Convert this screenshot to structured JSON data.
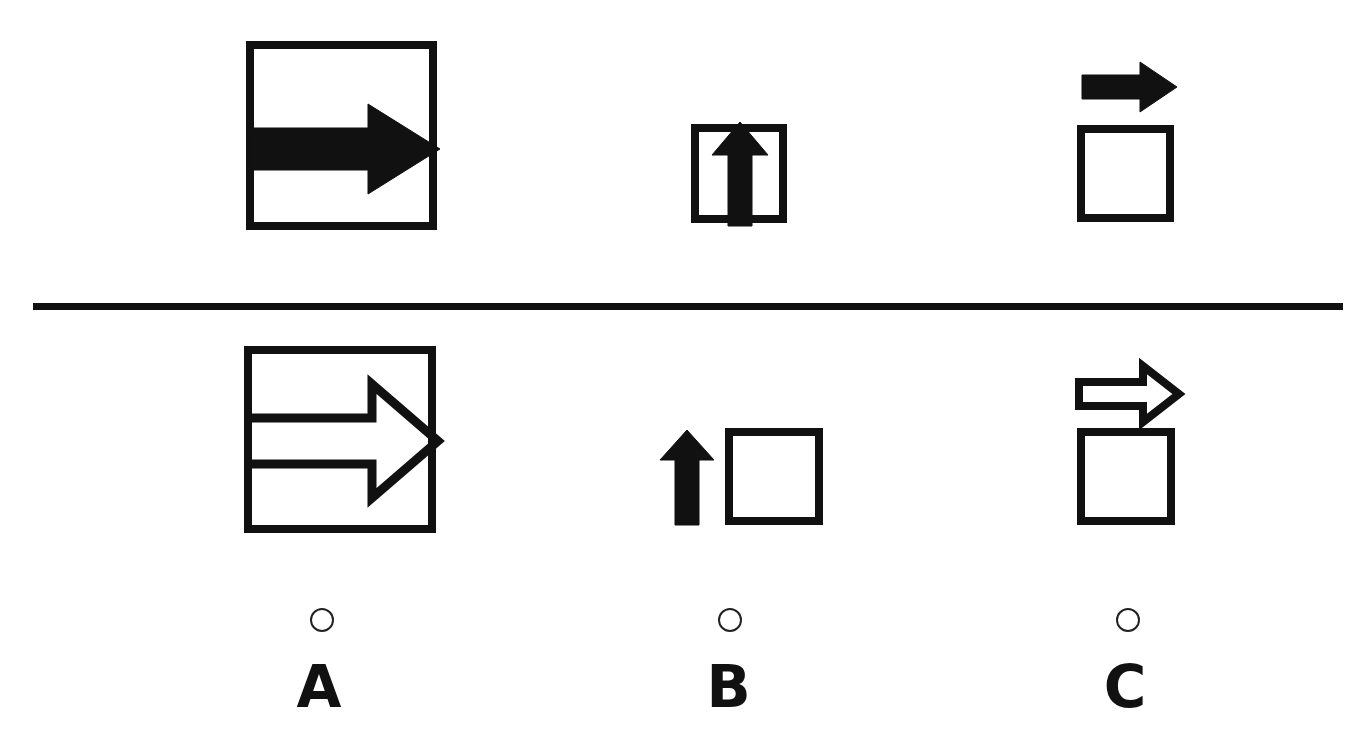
{
  "question": {
    "type": "visual-analogy-matrix",
    "prompt_row_label": "top-row-figures",
    "answer_row_label": "bottom-row-figures",
    "accent_color": "#111111",
    "background_color": "#ffffff",
    "divider": {
      "name": "horizontal-rule",
      "x": 33,
      "y": 303,
      "width": 1310,
      "height": 7,
      "color": "#111111"
    }
  },
  "top_row": {
    "items": [
      {
        "id": "top-A",
        "column": "A",
        "description": "filled right arrow inside large square",
        "square": {
          "x": 246,
          "y": 41,
          "w": 191,
          "h": 189,
          "stroke": 8,
          "fill": "none"
        },
        "arrow": {
          "direction": "right",
          "style": "filled",
          "x": 250,
          "y": 106,
          "w": 188,
          "h": 86,
          "position": "inside-square"
        }
      },
      {
        "id": "top-B",
        "column": "B",
        "description": "filled up arrow inside small square",
        "square": {
          "x": 691,
          "y": 124,
          "w": 96,
          "h": 99,
          "stroke": 8,
          "fill": "none"
        },
        "arrow": {
          "direction": "up",
          "style": "filled",
          "x": 712,
          "y": 122,
          "w": 54,
          "h": 101,
          "position": "inside-square"
        }
      },
      {
        "id": "top-C",
        "column": "C",
        "description": "filled right arrow above empty square",
        "square": {
          "x": 1077,
          "y": 125,
          "w": 97,
          "h": 97,
          "stroke": 8,
          "fill": "none"
        },
        "arrow": {
          "direction": "right",
          "style": "filled",
          "x": 1082,
          "y": 62,
          "w": 93,
          "h": 48,
          "position": "above-square"
        }
      }
    ]
  },
  "bottom_row": {
    "items": [
      {
        "id": "bottom-A",
        "column": "A",
        "description": "outlined right arrow inside large square",
        "square": {
          "x": 244,
          "y": 346,
          "w": 192,
          "h": 187,
          "stroke": 8,
          "fill": "none"
        },
        "arrow": {
          "direction": "right",
          "style": "outline",
          "x": 247,
          "y": 385,
          "w": 189,
          "h": 110,
          "position": "inside-square"
        }
      },
      {
        "id": "bottom-B",
        "column": "B",
        "description": "filled up arrow beside empty square",
        "square": {
          "x": 725,
          "y": 428,
          "w": 98,
          "h": 97,
          "stroke": 8,
          "fill": "none"
        },
        "arrow": {
          "direction": "up",
          "style": "filled",
          "x": 662,
          "y": 432,
          "w": 51,
          "h": 92,
          "position": "left-of-square"
        }
      },
      {
        "id": "bottom-C",
        "column": "C",
        "description": "outlined right arrow above empty square",
        "square": {
          "x": 1077,
          "y": 428,
          "w": 98,
          "h": 97,
          "stroke": 8,
          "fill": "none"
        },
        "arrow": {
          "direction": "right",
          "style": "outline",
          "x": 1081,
          "y": 368,
          "w": 97,
          "h": 52,
          "position": "above-square"
        }
      }
    ]
  },
  "options": [
    {
      "id": "option-a",
      "letter": "A",
      "selected": false,
      "circle": {
        "cx": 322,
        "cy": 620,
        "r": 12
      },
      "letter_x": 318,
      "letter_y": 662
    },
    {
      "id": "option-b",
      "letter": "B",
      "selected": false,
      "circle": {
        "cx": 730,
        "cy": 620,
        "r": 12
      },
      "letter_x": 728,
      "letter_y": 662
    },
    {
      "id": "option-c",
      "letter": "C",
      "selected": false,
      "circle": {
        "cx": 1128,
        "cy": 620,
        "r": 12
      },
      "letter_x": 1125,
      "letter_y": 662
    }
  ]
}
